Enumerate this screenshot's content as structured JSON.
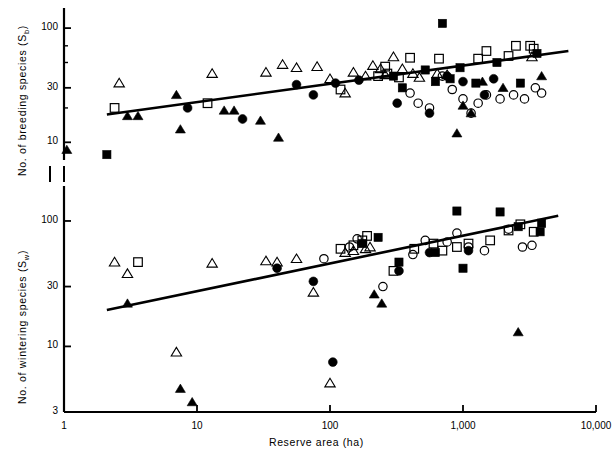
{
  "figure": {
    "background": "#ffffff",
    "ink": "#000000",
    "width": 603,
    "height": 462
  },
  "xaxis": {
    "label": "Reserve  area  (ha)",
    "scale": "log",
    "min": 1,
    "max": 10000,
    "tick_labels": [
      "1",
      "10",
      "100",
      "1,000",
      "10,000"
    ],
    "tick_values": [
      1,
      10,
      100,
      1000,
      10000
    ]
  },
  "panels": {
    "upper": {
      "ylabel_text": "No.  of  breeding  species  (S",
      "ylabel_sub": "b",
      "ylabel_tail": ")",
      "ylabel_full": "No. of breeding species (Sb)",
      "scale": "log",
      "tick_labels": [
        "10",
        "30",
        "100"
      ],
      "tick_values": [
        10,
        30,
        100
      ],
      "ymin": 7,
      "ymax": 150
    },
    "lower": {
      "ylabel_text": "No.  of  wintering  species  (S",
      "ylabel_sub": "w",
      "ylabel_tail": ")",
      "ylabel_full": "No. of wintering species (Sw)",
      "scale": "log",
      "tick_labels": [
        "3",
        "10",
        "30",
        "100"
      ],
      "tick_values": [
        3,
        10,
        30,
        100
      ],
      "ymin": 3,
      "ymax": 190
    }
  },
  "chart_data": [
    {
      "type": "scatter",
      "panel": "upper",
      "title": "No. of breeding species vs Reserve area",
      "xlabel": "Reserve area (ha)",
      "ylabel": "No. of breeding species (Sb)",
      "xscale": "log",
      "yscale": "log",
      "xlim": [
        1,
        10000
      ],
      "ylim": [
        7,
        150
      ],
      "grid": false,
      "legend": "none",
      "regression_line": {
        "x": [
          2.1,
          6200
        ],
        "y": [
          17.5,
          63
        ]
      },
      "series": [
        {
          "name": "open-triangle",
          "marker": "open-triangle",
          "points": [
            [
              2.6,
              33
            ],
            [
              13,
              40
            ],
            [
              33,
              41
            ],
            [
              44,
              48
            ],
            [
              56,
              45
            ],
            [
              80,
              46
            ],
            [
              100,
              36
            ],
            [
              130,
              27
            ],
            [
              150,
              41
            ],
            [
              185,
              38
            ],
            [
              210,
              47
            ],
            [
              240,
              44
            ],
            [
              260,
              39
            ],
            [
              300,
              56
            ],
            [
              350,
              44
            ],
            [
              420,
              40
            ],
            [
              470,
              37
            ],
            [
              640,
              40
            ],
            [
              760,
              39
            ],
            [
              3300,
              56
            ]
          ]
        },
        {
          "name": "filled-triangle",
          "marker": "filled-triangle",
          "points": [
            [
              1.05,
              8.6
            ],
            [
              3.0,
              17
            ],
            [
              3.6,
              17
            ],
            [
              7.0,
              26
            ],
            [
              7.5,
              13
            ],
            [
              16,
              19
            ],
            [
              19,
              19
            ],
            [
              30,
              15.5
            ],
            [
              41,
              11
            ],
            [
              900,
              12
            ],
            [
              1000,
              21
            ],
            [
              1150,
              18
            ],
            [
              1400,
              34
            ],
            [
              2000,
              30
            ],
            [
              3900,
              38
            ]
          ]
        },
        {
          "name": "open-square",
          "marker": "open-square",
          "points": [
            [
              2.4,
              20
            ],
            [
              12,
              22
            ],
            [
              120,
              29
            ],
            [
              230,
              38
            ],
            [
              260,
              46
            ],
            [
              270,
              40
            ],
            [
              330,
              37
            ],
            [
              400,
              55
            ],
            [
              660,
              54
            ],
            [
              1300,
              54
            ],
            [
              1500,
              63
            ],
            [
              2200,
              57
            ],
            [
              2500,
              70
            ],
            [
              3200,
              70
            ],
            [
              3400,
              66
            ]
          ]
        },
        {
          "name": "filled-square",
          "marker": "filled-square",
          "points": [
            [
              2.1,
              7.8
            ],
            [
              300,
              38
            ],
            [
              350,
              30
            ],
            [
              520,
              43
            ],
            [
              620,
              34
            ],
            [
              700,
              110
            ],
            [
              800,
              36
            ],
            [
              950,
              45
            ],
            [
              1250,
              33
            ],
            [
              1800,
              50
            ],
            [
              2700,
              33
            ],
            [
              3600,
              60
            ]
          ]
        },
        {
          "name": "open-circle",
          "marker": "open-circle",
          "points": [
            [
              400,
              27
            ],
            [
              460,
              22
            ],
            [
              560,
              20
            ],
            [
              700,
              38
            ],
            [
              830,
              29
            ],
            [
              1000,
              24
            ],
            [
              1150,
              18
            ],
            [
              1300,
              22
            ],
            [
              1500,
              26
            ],
            [
              1900,
              24
            ],
            [
              2400,
              26
            ],
            [
              2900,
              24
            ],
            [
              3500,
              30
            ],
            [
              3900,
              27
            ]
          ]
        },
        {
          "name": "filled-circle",
          "marker": "filled-circle",
          "points": [
            [
              8.5,
              20
            ],
            [
              22,
              16
            ],
            [
              56,
              32
            ],
            [
              75,
              26
            ],
            [
              110,
              33
            ],
            [
              165,
              35
            ],
            [
              320,
              22
            ],
            [
              560,
              18
            ],
            [
              760,
              38
            ],
            [
              1000,
              34
            ],
            [
              1450,
              26
            ],
            [
              1700,
              36
            ]
          ]
        }
      ]
    },
    {
      "type": "scatter",
      "panel": "lower",
      "title": "No. of wintering species vs Reserve area",
      "xlabel": "Reserve area (ha)",
      "ylabel": "No. of wintering species (Sw)",
      "xscale": "log",
      "yscale": "log",
      "xlim": [
        1,
        10000
      ],
      "ylim": [
        3,
        190
      ],
      "grid": false,
      "legend": "none",
      "regression_line": {
        "x": [
          2.1,
          5200
        ],
        "y": [
          19.5,
          110
        ]
      },
      "series": [
        {
          "name": "open-triangle",
          "marker": "open-triangle",
          "points": [
            [
              2.4,
              47
            ],
            [
              3.0,
              38
            ],
            [
              7.0,
              9.0
            ],
            [
              13,
              46
            ],
            [
              33,
              48
            ],
            [
              40,
              47
            ],
            [
              56,
              50
            ],
            [
              75,
              27
            ],
            [
              100,
              5.1
            ],
            [
              130,
              56
            ],
            [
              150,
              58
            ],
            [
              185,
              60
            ],
            [
              200,
              62
            ]
          ]
        },
        {
          "name": "filled-triangle",
          "marker": "filled-triangle",
          "points": [
            [
              3.0,
              22
            ],
            [
              7.5,
              4.6
            ],
            [
              9.2,
              3.6
            ],
            [
              215,
              26
            ],
            [
              245,
              22
            ],
            [
              2600,
              13
            ]
          ]
        },
        {
          "name": "open-square",
          "marker": "open-square",
          "points": [
            [
              3.6,
              47
            ],
            [
              120,
              60
            ],
            [
              150,
              64
            ],
            [
              175,
              70
            ],
            [
              190,
              76
            ],
            [
              300,
              40
            ],
            [
              430,
              60
            ],
            [
              600,
              66
            ],
            [
              700,
              58
            ],
            [
              900,
              62
            ],
            [
              1100,
              66
            ],
            [
              1600,
              70
            ],
            [
              2200,
              84
            ],
            [
              2700,
              94
            ],
            [
              3400,
              82
            ]
          ]
        },
        {
          "name": "filled-square",
          "marker": "filled-square",
          "points": [
            [
              175,
              66
            ],
            [
              230,
              74
            ],
            [
              330,
              47
            ],
            [
              620,
              56
            ],
            [
              900,
              120
            ],
            [
              1000,
              42
            ],
            [
              1900,
              118
            ],
            [
              2600,
              90
            ],
            [
              3800,
              82
            ],
            [
              3900,
              96
            ]
          ]
        },
        {
          "name": "open-circle",
          "marker": "open-circle",
          "points": [
            [
              90,
              50
            ],
            [
              140,
              62
            ],
            [
              160,
              72
            ],
            [
              250,
              30
            ],
            [
              420,
              54
            ],
            [
              520,
              70
            ],
            [
              760,
              68
            ],
            [
              900,
              80
            ],
            [
              1100,
              62
            ],
            [
              1450,
              58
            ],
            [
              2200,
              86
            ],
            [
              2800,
              62
            ],
            [
              3300,
              64
            ]
          ]
        },
        {
          "name": "filled-circle",
          "marker": "filled-circle",
          "points": [
            [
              40,
              42
            ],
            [
              75,
              33
            ],
            [
              105,
              7.5
            ],
            [
              330,
              40
            ],
            [
              560,
              56
            ],
            [
              1100,
              58
            ]
          ]
        }
      ]
    }
  ]
}
